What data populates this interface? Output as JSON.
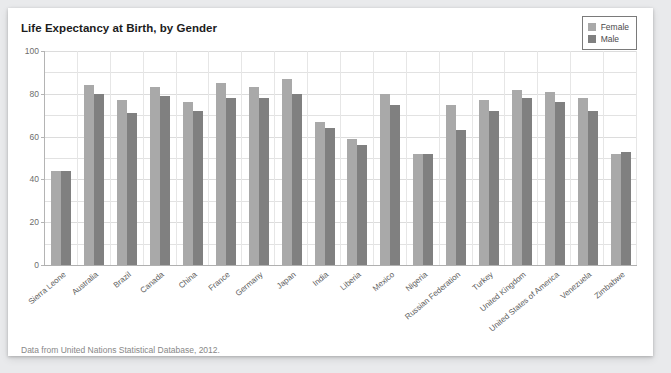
{
  "card": {
    "title": "Life Expectancy at Birth, by Gender",
    "footnote": "Data from United Nations Statistical Database, 2012."
  },
  "legend": {
    "items": [
      {
        "label": "Female",
        "color": "#a9a9a9"
      },
      {
        "label": "Male",
        "color": "#808080"
      }
    ]
  },
  "axis": {
    "y_ticks": [
      100,
      80,
      60,
      40,
      20,
      0
    ],
    "y_min": 0,
    "y_max": 100
  },
  "chart_data": {
    "type": "bar",
    "title": "Life Expectancy at Birth, by Gender",
    "xlabel": "",
    "ylabel": "",
    "ylim": [
      0,
      100
    ],
    "ytick_values": [
      0,
      20,
      40,
      60,
      80,
      100
    ],
    "grid": true,
    "legend_position": "top-right",
    "categories": [
      "Sierra Leone",
      "Australia",
      "Brazil",
      "Canada",
      "China",
      "France",
      "Germany",
      "Japan",
      "India",
      "Liberia",
      "Mexico",
      "Nigeria",
      "Russian Federation",
      "Turkey",
      "United Kingdom",
      "United States of America",
      "Venezuela",
      "Zimbabwe"
    ],
    "series": [
      {
        "name": "Female",
        "color": "#a9a9a9",
        "values": [
          44,
          84,
          77,
          83,
          76,
          85,
          83,
          87,
          67,
          59,
          80,
          52,
          75,
          77,
          82,
          81,
          78,
          52
        ]
      },
      {
        "name": "Male",
        "color": "#808080",
        "values": [
          44,
          80,
          71,
          79,
          72,
          78,
          78,
          80,
          64,
          56,
          75,
          52,
          63,
          72,
          78,
          76,
          72,
          53
        ]
      }
    ],
    "source": "Data from United Nations Statistical Database, 2012."
  }
}
